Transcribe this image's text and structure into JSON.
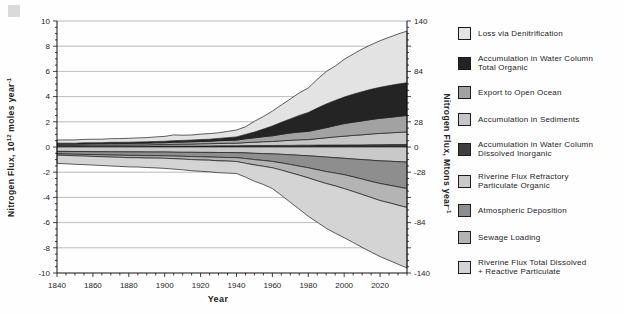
{
  "figure": {
    "xlabel": "Year",
    "ylabel_left_parts": {
      "a": "Nitrogen Flux, 10",
      "a_sup": "12",
      "b": " moles  year",
      "b_sup": "-1"
    },
    "ylabel_right_parts": {
      "a": "Nitrogen Flux, Mtons  year",
      "a_sup": "-1"
    }
  },
  "legend": {
    "position": "right",
    "items": [
      {
        "name": "loss-via-denitrification",
        "label_lines": [
          "Loss via Denitrification"
        ],
        "color": "#e3e3e3"
      },
      {
        "name": "accumulation-water-column-total-organic",
        "label_lines": [
          "Accumulation in Water Column",
          "Total Organic"
        ],
        "color": "#242424"
      },
      {
        "name": "export-to-open-ocean",
        "label_lines": [
          "Export to Open Ocean"
        ],
        "color": "#a2a2a2"
      },
      {
        "name": "accumulation-in-sediments",
        "label_lines": [
          "Accumulation in Sediments"
        ],
        "color": "#c6c6c6"
      },
      {
        "name": "accumulation-water-column-dissolved-inorganic",
        "label_lines": [
          "Accumulation in Water Column",
          "Dissolved Inorganic"
        ],
        "color": "#3f3f3f"
      },
      {
        "name": "riverine-flux-refractory-particulate-organic",
        "label_lines": [
          "Riverine Flux Refractory",
          "Particulate Organic"
        ],
        "color": "#c9c9c9"
      },
      {
        "name": "atmospheric-deposition",
        "label_lines": [
          "Atmospheric Deposition"
        ],
        "color": "#8e8e8e"
      },
      {
        "name": "sewage-loading",
        "label_lines": [
          "Sewage Loading"
        ],
        "color": "#b4b4b4"
      },
      {
        "name": "riverine-flux-total-dissolved-reactive-particulate",
        "label_lines": [
          "Riverine Flux Total Dissolved",
          "+ Reactive Particulate"
        ],
        "color": "#d4d4d4"
      }
    ]
  },
  "chart_data": {
    "type": "area",
    "stacked": true,
    "title": "",
    "xlabel": "Year",
    "ylabel_left": "Nitrogen Flux, 10¹² moles year⁻¹",
    "ylabel_right": "Nitrogen Flux, Mtons year⁻¹",
    "x_range": [
      1840,
      2035
    ],
    "ylim_left_moles": [
      -10,
      10
    ],
    "ylim_right_mtons": [
      -140,
      140
    ],
    "grid": true,
    "gridline_values": [
      -8,
      -6,
      -4,
      -2,
      0,
      2,
      4,
      6,
      8,
      10
    ],
    "x_ticks_labeled": [
      1840,
      1860,
      1880,
      1900,
      1920,
      1940,
      1960,
      1980,
      2000,
      2020
    ],
    "x_tick_minor_step": 5,
    "left_ticks": [
      {
        "at": 10,
        "label": "10"
      },
      {
        "at": 8,
        "label": "8"
      },
      {
        "at": 6,
        "label": "6"
      },
      {
        "at": 4,
        "label": "4"
      },
      {
        "at": 2,
        "label": "2"
      },
      {
        "at": 0,
        "label": "0"
      },
      {
        "at": -2,
        "label": "-2"
      },
      {
        "at": -4,
        "label": "-4"
      },
      {
        "at": -6,
        "label": "-6"
      },
      {
        "at": -8,
        "label": "-8"
      },
      {
        "at": -10,
        "label": "-10"
      }
    ],
    "right_ticks": [
      {
        "at": 10,
        "label": "140"
      },
      {
        "at": 6,
        "label": "84"
      },
      {
        "at": 2,
        "label": "28"
      },
      {
        "at": 0,
        "label": "0"
      },
      {
        "at": -2,
        "label": "-28"
      },
      {
        "at": -6,
        "label": "-84"
      },
      {
        "at": -10,
        "label": "-140"
      }
    ],
    "x": [
      1840,
      1845,
      1850,
      1855,
      1860,
      1865,
      1870,
      1875,
      1880,
      1885,
      1890,
      1895,
      1900,
      1905,
      1910,
      1915,
      1920,
      1925,
      1930,
      1935,
      1940,
      1945,
      1950,
      1955,
      1960,
      1965,
      1970,
      1975,
      1980,
      1985,
      1990,
      1995,
      2000,
      2005,
      2010,
      2015,
      2020,
      2025,
      2030,
      2035
    ],
    "series": [
      {
        "id": "din",
        "name": "Accumulation in Water Column Dissolved Inorganic",
        "direction": "up",
        "color": "#3f3f3f",
        "values": [
          0.04,
          0.04,
          0.04,
          0.04,
          0.05,
          0.05,
          0.05,
          0.05,
          0.06,
          0.06,
          0.06,
          0.07,
          0.07,
          0.08,
          0.08,
          0.08,
          0.09,
          0.09,
          0.1,
          0.1,
          0.1,
          0.11,
          0.11,
          0.12,
          0.12,
          0.13,
          0.13,
          0.14,
          0.14,
          0.15,
          0.15,
          0.16,
          0.16,
          0.17,
          0.17,
          0.18,
          0.18,
          0.19,
          0.19,
          0.2
        ]
      },
      {
        "id": "sediments",
        "name": "Accumulation in Sediments",
        "direction": "up",
        "color": "#c6c6c6",
        "values": [
          0.08,
          0.08,
          0.08,
          0.09,
          0.09,
          0.09,
          0.1,
          0.1,
          0.1,
          0.11,
          0.11,
          0.12,
          0.12,
          0.13,
          0.14,
          0.15,
          0.16,
          0.17,
          0.18,
          0.19,
          0.2,
          0.24,
          0.27,
          0.3,
          0.32,
          0.36,
          0.4,
          0.43,
          0.45,
          0.52,
          0.58,
          0.64,
          0.7,
          0.75,
          0.8,
          0.85,
          0.9,
          0.93,
          0.97,
          1.0
        ]
      },
      {
        "id": "export",
        "name": "Export to Open Ocean",
        "direction": "up",
        "color": "#a2a2a2",
        "values": [
          0.1,
          0.1,
          0.1,
          0.11,
          0.11,
          0.11,
          0.12,
          0.12,
          0.12,
          0.13,
          0.13,
          0.14,
          0.15,
          0.16,
          0.17,
          0.18,
          0.19,
          0.2,
          0.22,
          0.23,
          0.25,
          0.3,
          0.35,
          0.4,
          0.45,
          0.52,
          0.58,
          0.62,
          0.65,
          0.72,
          0.8,
          0.9,
          1.0,
          1.05,
          1.1,
          1.15,
          1.2,
          1.23,
          1.27,
          1.3
        ]
      },
      {
        "id": "total-organic",
        "name": "Accumulation in Water Column Total Organic",
        "direction": "up",
        "color": "#242424",
        "values": [
          0.08,
          0.08,
          0.08,
          0.09,
          0.09,
          0.09,
          0.1,
          0.1,
          0.1,
          0.1,
          0.11,
          0.11,
          0.12,
          0.13,
          0.13,
          0.14,
          0.15,
          0.16,
          0.18,
          0.22,
          0.25,
          0.35,
          0.45,
          0.6,
          0.78,
          0.95,
          1.12,
          1.32,
          1.5,
          1.7,
          1.88,
          2.0,
          2.1,
          2.22,
          2.32,
          2.4,
          2.46,
          2.52,
          2.56,
          2.6
        ]
      },
      {
        "id": "denitrification",
        "name": "Loss via Denitrification",
        "direction": "up",
        "color": "#e3e3e3",
        "values": [
          0.25,
          0.26,
          0.26,
          0.27,
          0.28,
          0.28,
          0.29,
          0.3,
          0.31,
          0.32,
          0.34,
          0.36,
          0.38,
          0.46,
          0.42,
          0.4,
          0.43,
          0.44,
          0.45,
          0.5,
          0.55,
          0.6,
          0.86,
          1.0,
          1.18,
          1.38,
          1.58,
          1.78,
          1.95,
          2.28,
          2.58,
          2.72,
          3.0,
          3.18,
          3.38,
          3.54,
          3.7,
          3.84,
          3.98,
          4.1
        ]
      },
      {
        "id": "refractory",
        "name": "Riverine Flux Refractory Particulate Organic",
        "direction": "down",
        "color": "#c9c9c9",
        "values": [
          0.35,
          0.35,
          0.36,
          0.36,
          0.37,
          0.37,
          0.38,
          0.38,
          0.39,
          0.39,
          0.4,
          0.4,
          0.4,
          0.41,
          0.42,
          0.42,
          0.43,
          0.43,
          0.44,
          0.44,
          0.45,
          0.47,
          0.5,
          0.52,
          0.55,
          0.58,
          0.62,
          0.66,
          0.7,
          0.75,
          0.8,
          0.85,
          0.9,
          0.95,
          1.0,
          1.05,
          1.1,
          1.13,
          1.17,
          1.2
        ]
      },
      {
        "id": "atmospheric",
        "name": "Atmospheric Deposition",
        "direction": "down",
        "color": "#8e8e8e",
        "values": [
          0.2,
          0.21,
          0.22,
          0.23,
          0.24,
          0.25,
          0.26,
          0.27,
          0.28,
          0.28,
          0.29,
          0.29,
          0.3,
          0.31,
          0.32,
          0.34,
          0.35,
          0.36,
          0.38,
          0.39,
          0.4,
          0.45,
          0.5,
          0.55,
          0.6,
          0.68,
          0.77,
          0.86,
          0.95,
          1.05,
          1.15,
          1.22,
          1.3,
          1.42,
          1.55,
          1.68,
          1.8,
          1.9,
          2.0,
          2.1
        ]
      },
      {
        "id": "sewage",
        "name": "Sewage Loading",
        "direction": "down",
        "color": "#b4b4b4",
        "values": [
          0.1,
          0.11,
          0.12,
          0.13,
          0.14,
          0.15,
          0.16,
          0.17,
          0.18,
          0.18,
          0.19,
          0.19,
          0.2,
          0.21,
          0.22,
          0.24,
          0.25,
          0.26,
          0.28,
          0.29,
          0.3,
          0.37,
          0.42,
          0.46,
          0.5,
          0.57,
          0.65,
          0.72,
          0.8,
          0.88,
          0.95,
          1.02,
          1.1,
          1.16,
          1.22,
          1.28,
          1.35,
          1.4,
          1.45,
          1.5
        ]
      },
      {
        "id": "riverine-total",
        "name": "Riverine Flux Total Dissolved + Reactive Particulate",
        "direction": "down",
        "color": "#d4d4d4",
        "values": [
          0.65,
          0.66,
          0.67,
          0.68,
          0.69,
          0.7,
          0.71,
          0.72,
          0.73,
          0.74,
          0.75,
          0.78,
          0.8,
          0.82,
          0.85,
          0.88,
          0.9,
          0.92,
          0.94,
          0.95,
          0.95,
          1.1,
          1.3,
          1.45,
          1.65,
          2.0,
          2.35,
          2.7,
          3.05,
          3.3,
          3.55,
          3.75,
          3.9,
          4.05,
          4.2,
          4.32,
          4.45,
          4.57,
          4.68,
          4.8
        ]
      }
    ]
  }
}
